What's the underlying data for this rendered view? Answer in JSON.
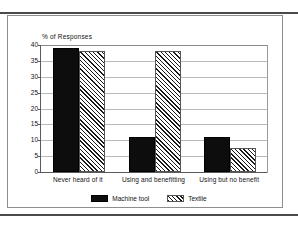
{
  "figure": {
    "frame_border_color": "#8d8d8d",
    "rule_color": "#4a4a4a"
  },
  "chart_data": {
    "type": "bar",
    "title": "",
    "xlabel": "",
    "ylabel": "% of Responses",
    "ylim": [
      0,
      40
    ],
    "yticks": [
      0,
      5,
      10,
      15,
      20,
      25,
      30,
      35,
      40
    ],
    "ytick_labels": [
      "0",
      "5",
      "10",
      "15",
      "20",
      "25",
      "30",
      "35",
      "40"
    ],
    "grid": true,
    "legend_position": "bottom-center",
    "categories": [
      "Never heard of it",
      "Using and benefitting",
      "Using but no benefit"
    ],
    "series": [
      {
        "name": "Machine tool",
        "fill": "solid",
        "color": "#0d0d0d",
        "values": [
          39,
          11,
          11
        ]
      },
      {
        "name": "Textile",
        "fill": "diagonal-hatch",
        "color": "#1a1a1a",
        "values": [
          38,
          38,
          7.5
        ]
      }
    ]
  }
}
